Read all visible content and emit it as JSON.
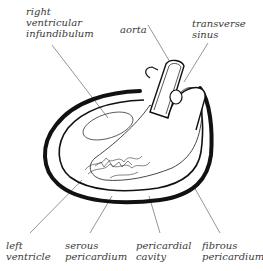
{
  "diagram": {
    "labels": {
      "right_ventricular_infundibulum": [
        "right",
        "ventricular",
        "infundibulum"
      ],
      "aorta": [
        "aorta"
      ],
      "transverse_sinus": [
        "transverse",
        "sinus"
      ],
      "left_ventricle": [
        "left",
        "ventricle"
      ],
      "serous_pericardium": [
        "serous",
        "pericardium"
      ],
      "pericardial_cavity": [
        "pericardial",
        "cavity"
      ],
      "fibrous_pericardium": [
        "fibrous",
        "pericardium"
      ]
    },
    "colors": {
      "outline": "#111111",
      "leader_line": "#7a7a7a",
      "text": "#3a3a3a"
    }
  }
}
